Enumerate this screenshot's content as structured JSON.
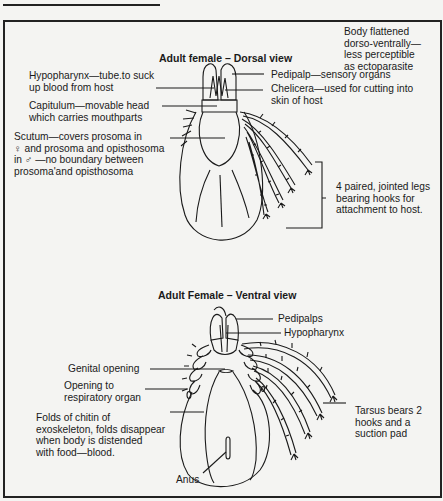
{
  "dorsal": {
    "title": "Adult female – Dorsal view",
    "note": "Body flattened\ndorso-ventrally—\nless perceptible\nas ectoparasite",
    "labels": {
      "hypopharynx": "Hypopharynx—tube.to suck\nup blood from host",
      "capitulum": "Capitulum—movable head\nwhich carries mouthparts",
      "scutum": "Scutum—covers prosoma in\n♀ and prosoma and opisthosoma\nin ♂ —no boundary between\nprosoma'and opisthosoma",
      "pedipalp": "Pedipalp—sensory organs",
      "chelicera": "Chelicera—used for cutting into\nskin of host",
      "legs": "4 paired, jointed legs\nbearing hooks for\nattachment to host."
    }
  },
  "ventral": {
    "title": "Adult Female – Ventral view",
    "labels": {
      "pedipalps": "Pedipalps",
      "hypopharynx": "Hypopharynx",
      "genital_opening": "Genital opening",
      "respiratory_opening": "Opening to\nrespiratory organ",
      "folds": "Folds of chitin of\nexoskeleton, folds disappear\nwhen body is distended\nwith food—blood.",
      "anus": "Anus",
      "tarsus": "Tarsus bears 2\nhooks and a\nsuction pad"
    }
  }
}
